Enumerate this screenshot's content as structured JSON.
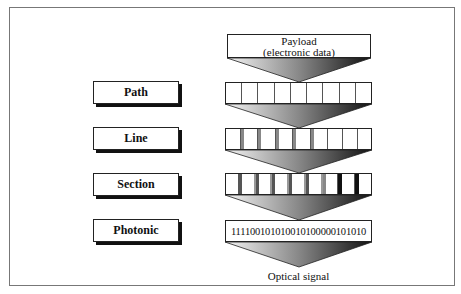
{
  "diagram": {
    "payload": {
      "line1": "Payload",
      "line2": "(electronic data)"
    },
    "layers": [
      {
        "label": "Path",
        "cells": 9
      },
      {
        "label": "Line",
        "cells": 9
      },
      {
        "label": "Section",
        "cells": 9
      },
      {
        "label": "Photonic",
        "bits": "111100101010010100000101010"
      }
    ],
    "output_label": "Optical signal"
  }
}
